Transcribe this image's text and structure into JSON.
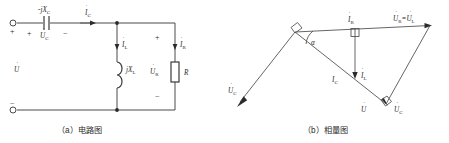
{
  "figure": {
    "panels": [
      {
        "id": "a",
        "caption": "（a）电路图",
        "type": "circuit-diagram",
        "labels": {
          "capacitor_impedance": "-jX",
          "capacitor_impedance_sub": "C",
          "capacitor_voltage": "U",
          "capacitor_voltage_sub": "C",
          "capacitor_current": "I",
          "capacitor_current_sub": "C",
          "inductor_impedance": "jX",
          "inductor_impedance_sub": "L",
          "inductor_current": "I",
          "inductor_current_sub": "L",
          "resistor_current": "I",
          "resistor_current_sub": "R",
          "resistor_voltage": "U",
          "resistor_voltage_sub": "R",
          "resistor_name": "R",
          "source_voltage": "U",
          "plus_terminal": "+",
          "minus_terminal": "−",
          "plus_cap": "+",
          "minus_cap": "−",
          "plus_res": "+",
          "minus_res": "−"
        }
      },
      {
        "id": "b",
        "caption": "（b）相量图",
        "type": "phasor-diagram",
        "labels": {
          "current_r": "I",
          "current_r_sub": "R",
          "voltage_r_eq_l": "U",
          "voltage_r_sub": "R",
          "voltage_r_eq": "=U",
          "voltage_l_sub": "L",
          "current_c": "I",
          "current_c_sub": "C",
          "current_l": "I",
          "current_l_sub": "L",
          "voltage_total": "U",
          "voltage_c_right": "U",
          "voltage_c_right_sub": "C",
          "voltage_c_left": "U",
          "voltage_c_left_sub": "C",
          "angle_alpha": "α"
        }
      }
    ]
  },
  "colors": {
    "line": "#4a4a4a",
    "text": "#2b2b2b",
    "background": "#ffffff"
  }
}
